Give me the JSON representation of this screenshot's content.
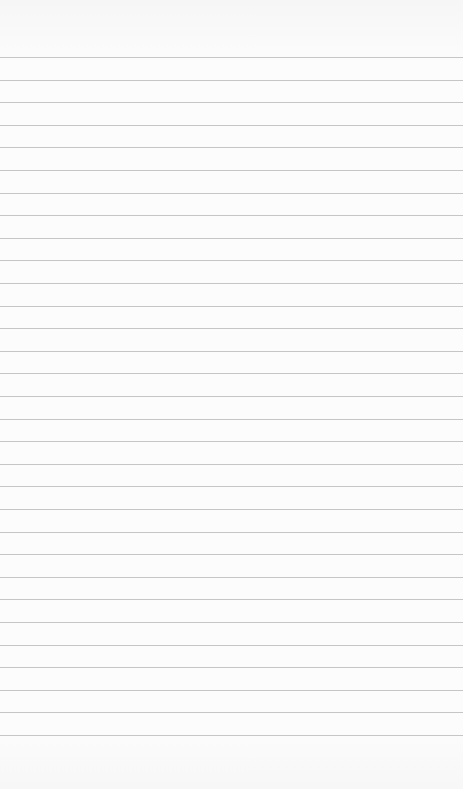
{
  "page": {
    "type": "lined-paper",
    "background_color": "#fafafa",
    "rule_color": "#c6c6c6",
    "first_rule_y": 57,
    "rule_spacing": 22.6,
    "rule_count": 31
  }
}
